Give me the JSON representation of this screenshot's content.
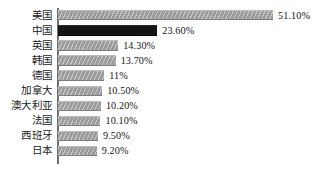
{
  "chart_data": {
    "type": "bar",
    "orientation": "horizontal",
    "title": "",
    "subtitle": "",
    "xlabel": "",
    "ylabel": "",
    "xlim": [
      0,
      51.1
    ],
    "grid": false,
    "legend": null,
    "value_suffix": "%",
    "categories": [
      "美国",
      "中国",
      "英国",
      "韩国",
      "德国",
      "加拿大",
      "澳大利亚",
      "法国",
      "西班牙",
      "日本"
    ],
    "values": [
      51.1,
      23.6,
      14.3,
      13.7,
      11,
      10.5,
      10.2,
      10.1,
      9.5,
      9.2
    ],
    "value_labels": [
      "51.10%",
      "23.60%",
      "14.30%",
      "13.70%",
      "11%",
      "10.50%",
      "10.20%",
      "10.10%",
      "9.50%",
      "9.20%"
    ],
    "bar_styles": [
      "hatched-gray",
      "solid-black",
      "hatched-gray",
      "hatched-gray",
      "hatched-gray",
      "hatched-gray",
      "hatched-gray",
      "hatched-gray",
      "hatched-gray",
      "hatched-gray"
    ],
    "highlight_category": "中国"
  },
  "colors": {
    "background": "#ffffff",
    "bar_gray": "#9b9b9b",
    "bar_highlight": "#151515",
    "axis": "#6f6f6f",
    "text": "#1b1b1b"
  },
  "rows": [
    {
      "label": "美国",
      "value": 51.1,
      "value_label": "51.10%",
      "highlight": false
    },
    {
      "label": "中国",
      "value": 23.6,
      "value_label": "23.60%",
      "highlight": true
    },
    {
      "label": "英国",
      "value": 14.3,
      "value_label": "14.30%",
      "highlight": false
    },
    {
      "label": "韩国",
      "value": 13.7,
      "value_label": "13.70%",
      "highlight": false
    },
    {
      "label": "德国",
      "value": 11,
      "value_label": "11%",
      "highlight": false
    },
    {
      "label": "加拿大",
      "value": 10.5,
      "value_label": "10.50%",
      "highlight": false
    },
    {
      "label": "澳大利亚",
      "value": 10.2,
      "value_label": "10.20%",
      "highlight": false
    },
    {
      "label": "法国",
      "value": 10.1,
      "value_label": "10.10%",
      "highlight": false
    },
    {
      "label": "西班牙",
      "value": 9.5,
      "value_label": "9.50%",
      "highlight": false
    },
    {
      "label": "日本",
      "value": 9.2,
      "value_label": "9.20%",
      "highlight": false
    }
  ]
}
